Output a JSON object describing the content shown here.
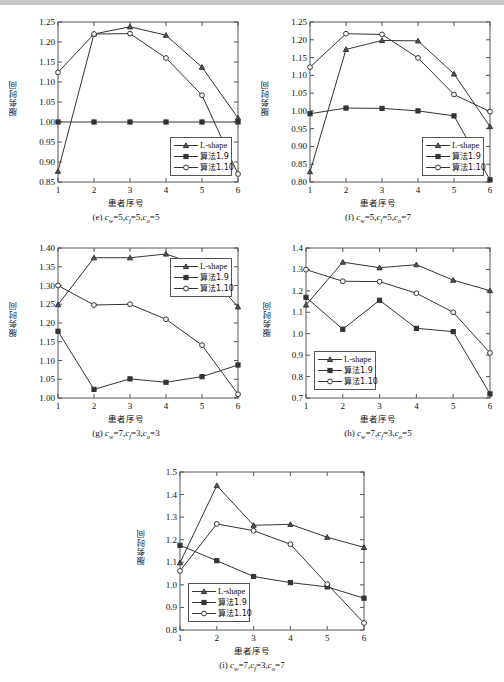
{
  "figure": {
    "axis_labels": {
      "x": "患者序号",
      "y": "服务时间"
    },
    "legend_entries": [
      {
        "label": "L-shape",
        "marker": "triangle-marker"
      },
      {
        "label": "算法1.9",
        "marker": "square-marker"
      },
      {
        "label": "算法1.10",
        "marker": "circle-marker"
      }
    ],
    "x_categories": [
      "1",
      "2",
      "3",
      "4",
      "5",
      "6"
    ]
  },
  "chart_data": [
    {
      "id": "chart-e",
      "type": "line",
      "title": "",
      "caption": "(e) c_w=5,c_f=5,c_o=5",
      "caption_parts": {
        "tag": "(e)",
        "cw": "5",
        "cf": "5",
        "co": "5"
      },
      "xlabel": "患者序号",
      "ylabel": "服务时间",
      "x": [
        1,
        2,
        3,
        4,
        5,
        6
      ],
      "xticklabels": [
        "1",
        "2",
        "3",
        "4",
        "5",
        "6"
      ],
      "ylim": [
        0.85,
        1.25
      ],
      "yticks": [
        0.85,
        0.9,
        0.95,
        1.0,
        1.05,
        1.1,
        1.15,
        1.2,
        1.25
      ],
      "yticklabels": [
        "0.85",
        "0.90",
        "0.95",
        "1.00",
        "1.05",
        "1.10",
        "1.15",
        "1.20",
        "1.25"
      ],
      "grid": false,
      "legend_position": "lower-right",
      "series": [
        {
          "name": "L-shape",
          "marker": "triangle",
          "values": [
            0.877,
            1.22,
            1.238,
            1.217,
            1.137,
            1.01
          ]
        },
        {
          "name": "算法1.9",
          "marker": "square",
          "values": [
            1.0,
            1.0,
            1.0,
            1.0,
            1.0,
            1.0
          ]
        },
        {
          "name": "算法1.10",
          "marker": "circle",
          "values": [
            1.124,
            1.22,
            1.221,
            1.16,
            1.067,
            0.87
          ]
        }
      ]
    },
    {
      "id": "chart-f",
      "type": "line",
      "title": "",
      "caption": "(f) c_w=5,c_f=5,c_o=7",
      "caption_parts": {
        "tag": "(f)",
        "cw": "5",
        "cf": "5",
        "co": "7"
      },
      "xlabel": "患者序号",
      "ylabel": "服务时间",
      "x": [
        1,
        2,
        3,
        4,
        5,
        6
      ],
      "xticklabels": [
        "1",
        "2",
        "3",
        "4",
        "5",
        "6"
      ],
      "ylim": [
        0.8,
        1.25
      ],
      "yticks": [
        0.8,
        0.85,
        0.9,
        0.95,
        1.0,
        1.05,
        1.1,
        1.15,
        1.2,
        1.25
      ],
      "yticklabels": [
        "0.80",
        "0.85",
        "0.90",
        "0.95",
        "1.00",
        "1.05",
        "1.10",
        "1.15",
        "1.20",
        "1.25"
      ],
      "grid": false,
      "legend_position": "lower-right",
      "series": [
        {
          "name": "L-shape",
          "marker": "triangle",
          "values": [
            0.829,
            1.173,
            1.198,
            1.197,
            1.104,
            0.956
          ]
        },
        {
          "name": "算法1.9",
          "marker": "square",
          "values": [
            0.992,
            1.008,
            1.007,
            1.0,
            0.986,
            0.806
          ]
        },
        {
          "name": "算法1.10",
          "marker": "circle",
          "values": [
            1.123,
            1.217,
            1.215,
            1.149,
            1.046,
            0.998
          ]
        }
      ]
    },
    {
      "id": "chart-g",
      "type": "line",
      "title": "",
      "caption": "(g) c_w=7,c_f=3,c_o=3",
      "caption_parts": {
        "tag": "(g)",
        "cw": "7",
        "cf": "3",
        "co": "3"
      },
      "xlabel": "患者序号",
      "ylabel": "服务时间",
      "x": [
        1,
        2,
        3,
        4,
        5,
        6
      ],
      "xticklabels": [
        "1",
        "2",
        "3",
        "4",
        "5",
        "6"
      ],
      "ylim": [
        1.0,
        1.4
      ],
      "yticks": [
        1.0,
        1.05,
        1.1,
        1.15,
        1.2,
        1.25,
        1.3,
        1.35,
        1.4
      ],
      "yticklabels": [
        "1.00",
        "1.05",
        "1.10",
        "1.15",
        "1.20",
        "1.25",
        "1.30",
        "1.35",
        "1.40"
      ],
      "grid": false,
      "legend_position": "upper-right",
      "series": [
        {
          "name": "L-shape",
          "marker": "triangle",
          "values": [
            1.249,
            1.374,
            1.374,
            1.384,
            1.351,
            1.243
          ]
        },
        {
          "name": "算法1.9",
          "marker": "square",
          "values": [
            1.178,
            1.023,
            1.051,
            1.042,
            1.057,
            1.088
          ]
        },
        {
          "name": "算法1.10",
          "marker": "circle",
          "values": [
            1.3,
            1.248,
            1.25,
            1.21,
            1.141,
            1.01
          ]
        }
      ]
    },
    {
      "id": "chart-h",
      "type": "line",
      "title": "",
      "caption": "(h) c_w=7,c_f=3,c_o=5",
      "caption_parts": {
        "tag": "(h)",
        "cw": "7",
        "cf": "3",
        "co": "5"
      },
      "xlabel": "患者序号",
      "ylabel": "服务时间",
      "x": [
        1,
        2,
        3,
        4,
        5,
        6
      ],
      "xticklabels": [
        "1",
        "2",
        "3",
        "4",
        "5",
        "6"
      ],
      "ylim": [
        0.7,
        1.4
      ],
      "yticks": [
        0.7,
        0.8,
        0.9,
        1.0,
        1.1,
        1.2,
        1.3,
        1.4
      ],
      "yticklabels": [
        "0.7",
        "0.8",
        "0.9",
        "1.0",
        "1.1",
        "1.2",
        "1.3",
        "1.4"
      ],
      "grid": false,
      "legend_position": "lower-left",
      "series": [
        {
          "name": "L-shape",
          "marker": "triangle",
          "values": [
            1.134,
            1.334,
            1.308,
            1.322,
            1.25,
            1.201
          ]
        },
        {
          "name": "算法1.9",
          "marker": "square",
          "values": [
            1.17,
            1.021,
            1.156,
            1.025,
            1.01,
            0.719
          ]
        },
        {
          "name": "算法1.10",
          "marker": "circle",
          "values": [
            1.299,
            1.245,
            1.243,
            1.189,
            1.1,
            0.91
          ]
        }
      ]
    },
    {
      "id": "chart-i",
      "type": "line",
      "title": "",
      "caption": "(i) c_w=7,c_f=3,c_o=7",
      "caption_parts": {
        "tag": "(i)",
        "cw": "7",
        "cf": "3",
        "co": "7"
      },
      "xlabel": "患者序号",
      "ylabel": "服务时间",
      "x": [
        1,
        2,
        3,
        4,
        5,
        6
      ],
      "xticklabels": [
        "1",
        "2",
        "3",
        "4",
        "5",
        "6"
      ],
      "ylim": [
        0.8,
        1.5
      ],
      "yticks": [
        0.8,
        0.9,
        1.0,
        1.1,
        1.2,
        1.3,
        1.4,
        1.5
      ],
      "yticklabels": [
        "0.8",
        "0.9",
        "1.0",
        "1.1",
        "1.2",
        "1.3",
        "1.4",
        "1.5"
      ],
      "grid": false,
      "legend_position": "lower-left",
      "series": [
        {
          "name": "L-shape",
          "marker": "triangle",
          "values": [
            1.098,
            1.44,
            1.264,
            1.268,
            1.211,
            1.166
          ]
        },
        {
          "name": "算法1.9",
          "marker": "square",
          "values": [
            1.175,
            1.107,
            1.037,
            1.01,
            0.991,
            0.941
          ]
        },
        {
          "name": "算法1.10",
          "marker": "circle",
          "values": [
            1.062,
            1.27,
            1.24,
            1.18,
            1.003,
            0.831
          ]
        }
      ]
    }
  ]
}
